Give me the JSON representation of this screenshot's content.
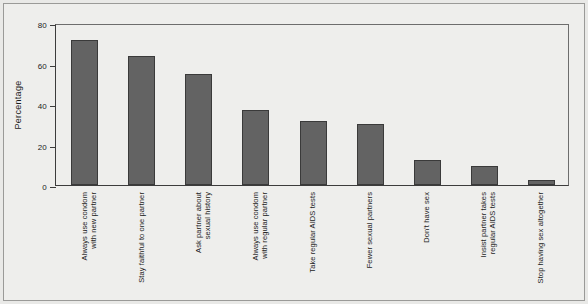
{
  "figure": {
    "background_color": "#eeeeec",
    "frame_color": "#9a9a98",
    "bar_color": "#636363",
    "bar_edge_color": "#3a3a3a",
    "axis_color": "#3c3c3c",
    "text_color": "#1c1c1c"
  },
  "chart_data": {
    "type": "bar",
    "title": "",
    "subtitle": "",
    "xlabel": "",
    "ylabel": "Percentage",
    "ylim": [
      0,
      80
    ],
    "yticks": [
      0,
      20,
      40,
      60,
      80
    ],
    "ytick_labels": [
      "0",
      "20",
      "40",
      "60",
      "80"
    ],
    "grid": false,
    "legend": false,
    "legend_position": "none",
    "orientation": "vertical",
    "categories": [
      "Always use condom with new partner",
      "Stay faithful to one partner",
      "Ask partner about sexual history",
      "Always use condom with regular partner",
      "Take regular AIDS tests",
      "Fewer sexual partners",
      "Don't have sex",
      "Insist partner takes regular AIDS tests",
      "Stop having sex altogether"
    ],
    "category_lines": [
      [
        "Always use condom",
        "with new partner"
      ],
      [
        "Stay faithful to one partner"
      ],
      [
        "Ask partner about",
        "sexual history"
      ],
      [
        "Always use condom",
        "with regular partner"
      ],
      [
        "Take regular AIDS tests"
      ],
      [
        "Fewer sexual partners"
      ],
      [
        "Don't have sex"
      ],
      [
        "Insist partner takes",
        "regular AIDS tests"
      ],
      [
        "Stop having sex altogether"
      ]
    ],
    "values": [
      71.5,
      63.5,
      55,
      37,
      31.5,
      30,
      12.5,
      9.5,
      2.5
    ],
    "annotations": []
  }
}
